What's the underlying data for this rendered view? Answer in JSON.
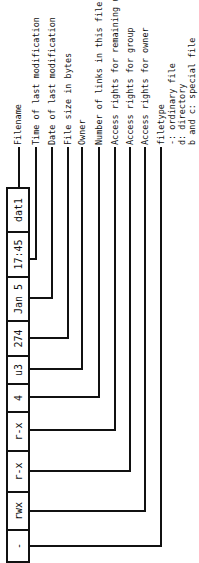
{
  "fields": [
    {
      "value": "-",
      "label": "filetype",
      "notes": [
        "-: ordinary file",
        "d: directory",
        "b and c: special file"
      ]
    },
    {
      "value": "rwx",
      "label": "Access rights for owner"
    },
    {
      "value": "r-x",
      "label": "Access rights for group"
    },
    {
      "value": "r-x",
      "label": "Access rights for remaining users"
    },
    {
      "value": "4",
      "label": "Number of links in this file"
    },
    {
      "value": "u3",
      "label": "Owner"
    },
    {
      "value": "274",
      "label": "File size in bytes"
    },
    {
      "value": "Jan 5",
      "label": "Date of last modification"
    },
    {
      "value": "17:45",
      "label": "Time of last modification"
    },
    {
      "value": "dat1",
      "label": "Filename"
    }
  ]
}
